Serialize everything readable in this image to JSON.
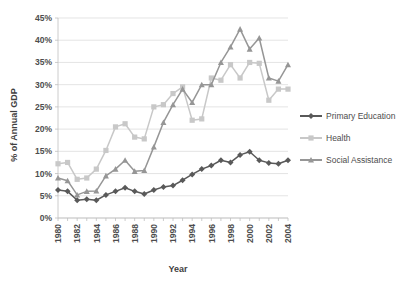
{
  "chart_data": {
    "type": "line",
    "title": "",
    "xlabel": "Year",
    "ylabel": "% of Annual GDP",
    "xlim": [
      1980,
      2004
    ],
    "ylim": [
      0,
      45
    ],
    "ytick_labels": [
      "0%",
      "5%",
      "10%",
      "15%",
      "20%",
      "25%",
      "30%",
      "35%",
      "40%",
      "45%"
    ],
    "ytick_values": [
      0,
      5,
      10,
      15,
      20,
      25,
      30,
      35,
      40,
      45
    ],
    "xtick_labels": [
      "1980",
      "1982",
      "1984",
      "1986",
      "1988",
      "1990",
      "1992",
      "1994",
      "1996",
      "1998",
      "2000",
      "2002",
      "2004"
    ],
    "xtick_values": [
      1980,
      1982,
      1984,
      1986,
      1988,
      1990,
      1992,
      1994,
      1996,
      1998,
      2000,
      2002,
      2004
    ],
    "grid": true,
    "legend_position": "right",
    "x": [
      1980,
      1981,
      1982,
      1983,
      1984,
      1985,
      1986,
      1987,
      1988,
      1989,
      1990,
      1991,
      1992,
      1993,
      1994,
      1995,
      1996,
      1997,
      1998,
      1999,
      2000,
      2001,
      2002,
      2003,
      2004
    ],
    "series": [
      {
        "name": "Primary Education",
        "color": "#595959",
        "marker": "diamond",
        "values": [
          6.3,
          6.0,
          4.0,
          4.2,
          4.0,
          5.2,
          6.0,
          6.8,
          6.0,
          5.4,
          6.3,
          7.0,
          7.3,
          8.5,
          9.8,
          11.0,
          11.8,
          13.0,
          12.5,
          14.2,
          14.9,
          13.0,
          12.4,
          12.2,
          13.0
        ]
      },
      {
        "name": "Health",
        "color": "#c8c8c8",
        "marker": "square",
        "values": [
          12.2,
          12.5,
          8.7,
          9.0,
          11.0,
          15.2,
          20.5,
          21.2,
          18.2,
          17.8,
          25.0,
          25.5,
          28.0,
          29.5,
          22.0,
          22.3,
          31.5,
          31.0,
          34.5,
          31.5,
          35.0,
          34.8,
          26.5,
          29.0,
          29.0
        ]
      },
      {
        "name": "Social Assistance",
        "color": "#969696",
        "marker": "triangle",
        "values": [
          9.0,
          8.4,
          5.2,
          6.0,
          6.1,
          9.5,
          11.0,
          13.0,
          10.5,
          10.7,
          16.0,
          21.5,
          25.5,
          29.0,
          26.0,
          30.0,
          30.0,
          35.0,
          38.5,
          42.5,
          38.0,
          40.5,
          31.5,
          30.8,
          34.5
        ]
      }
    ]
  },
  "legend": {
    "items": [
      {
        "label": "Primary Education"
      },
      {
        "label": "Health"
      },
      {
        "label": "Social Assistance"
      }
    ]
  }
}
